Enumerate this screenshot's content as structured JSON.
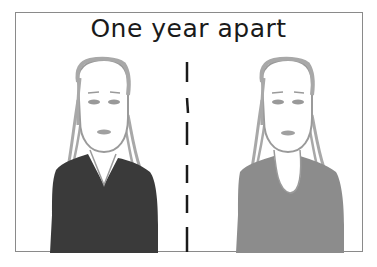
{
  "comic": {
    "title": "One year apart",
    "panels": [
      {
        "label": "before",
        "shirt_color": "#3a3a3a",
        "neckline": "v-neck"
      },
      {
        "label": "after",
        "shirt_color": "#8c8c8c",
        "neckline": "scoop-neck"
      }
    ],
    "divider": "dashed-vertical-line",
    "colors": {
      "frame": "#8a8a8a",
      "hair": "#a8a8a8",
      "face_outline": "#9a9a9a",
      "dark_shirt": "#3a3a3a",
      "light_shirt": "#8c8c8c",
      "divider": "#1a1a1a",
      "title_text": "#1a1a1a"
    }
  }
}
